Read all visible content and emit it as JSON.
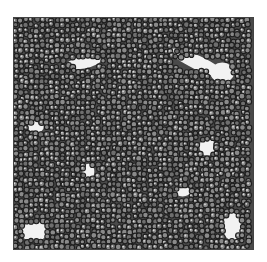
{
  "image": {
    "description": "Grayscale micrograph of densely packed round cells with lighter interstitial gaps",
    "colors": {
      "background": "#ffffff",
      "cell_dark": "#1e1e1e",
      "cell_mid": "#6e6e6e",
      "cell_light": "#d8d8d8",
      "gap": "#f2f2f2",
      "border": "#444444"
    },
    "gaps": [
      {
        "cx": 70,
        "cy": 45,
        "rx": 18,
        "ry": 6,
        "rot": -10
      },
      {
        "cx": 185,
        "cy": 45,
        "rx": 30,
        "ry": 7,
        "rot": 25
      },
      {
        "cx": 210,
        "cy": 55,
        "rx": 12,
        "ry": 10,
        "rot": 0
      },
      {
        "cx": 22,
        "cy": 110,
        "rx": 8,
        "ry": 6,
        "rot": 0
      },
      {
        "cx": 195,
        "cy": 130,
        "rx": 8,
        "ry": 9,
        "rot": 0
      },
      {
        "cx": 75,
        "cy": 155,
        "rx": 6,
        "ry": 8,
        "rot": 0
      },
      {
        "cx": 170,
        "cy": 175,
        "rx": 8,
        "ry": 5,
        "rot": 0
      },
      {
        "cx": 20,
        "cy": 215,
        "rx": 14,
        "ry": 10,
        "rot": 0
      },
      {
        "cx": 220,
        "cy": 210,
        "rx": 10,
        "ry": 14,
        "rot": 0
      }
    ]
  }
}
